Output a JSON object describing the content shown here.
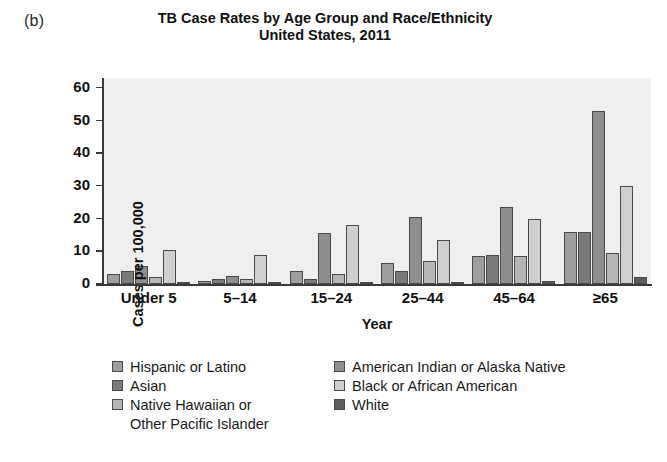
{
  "panel_label": "(b)",
  "title": {
    "line1": "TB Case Rates by Age Group and Race/Ethnicity",
    "line2": "United States, 2011"
  },
  "axes": {
    "ylabel": "Cases per 100,000",
    "xlabel": "Year",
    "yticks": [
      "0",
      "10",
      "20",
      "30",
      "40",
      "50",
      "60"
    ]
  },
  "legend": {
    "left": [
      {
        "label": "Hispanic or Latino",
        "color": "#9e9e9e"
      },
      {
        "label": "Asian",
        "color": "#7a7a7a"
      },
      {
        "label": "Native Hawaiian or",
        "cont": "Other Pacific Islander",
        "color": "#b5b5b5"
      }
    ],
    "right": [
      {
        "label": "American Indian or Alaska Native",
        "color": "#8e8e8e"
      },
      {
        "label": "Black or African American",
        "color": "#cfcfcf"
      },
      {
        "label": "White",
        "color": "#5e5e5e"
      }
    ]
  },
  "chart_data": {
    "type": "bar",
    "title": "TB Case Rates by Age Group and Race/Ethnicity United States, 2011",
    "xlabel": "Year",
    "ylabel": "Cases per 100,000",
    "ylim": [
      0,
      63
    ],
    "yticks": [
      0,
      10,
      20,
      30,
      40,
      50,
      60
    ],
    "grid": false,
    "legend_position": "below",
    "categories": [
      "Under 5",
      "5–14",
      "15–24",
      "25–44",
      "45–64",
      "≥65"
    ],
    "series": [
      {
        "name": "Hispanic or Latino",
        "color": "#9e9e9e",
        "values": [
          3,
          1,
          4,
          6.5,
          8.5,
          16
        ]
      },
      {
        "name": "Asian",
        "color": "#7a7a7a",
        "values": [
          4,
          1.5,
          1.5,
          4,
          9,
          16
        ]
      },
      {
        "name": "American Indian or Alaska Native",
        "color": "#8e8e8e",
        "values": [
          5.5,
          2.5,
          15.5,
          20.5,
          23.5,
          53
        ]
      },
      {
        "name": "Native Hawaiian or Other Pacific Islander",
        "color": "#b5b5b5",
        "values": [
          2,
          1.5,
          3,
          7,
          8.5,
          9.5
        ]
      },
      {
        "name": "Black or African American",
        "color": "#cfcfcf",
        "values": [
          10.5,
          9,
          18,
          13.5,
          20,
          30
        ]
      },
      {
        "name": "White",
        "color": "#5e5e5e",
        "values": [
          0.5,
          0.3,
          0.5,
          0.5,
          1,
          2
        ]
      }
    ]
  }
}
